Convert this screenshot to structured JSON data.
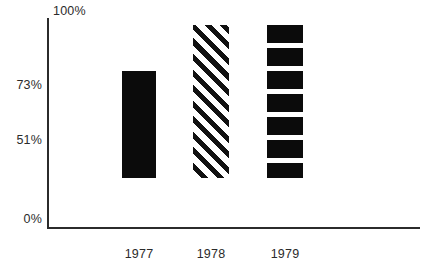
{
  "chart_data": {
    "type": "bar",
    "title": "",
    "subtitle": "",
    "xlabel": "",
    "ylabel": "",
    "categories": [
      "1977",
      "1978",
      "1979"
    ],
    "values": [
      51,
      73,
      73
    ],
    "ylim": [
      0,
      100
    ],
    "ytick_labels": [
      "0%",
      "51%",
      "73%",
      "100%"
    ],
    "ytick_values": [
      0,
      51,
      73,
      100
    ],
    "xtick_labels": [
      "1977",
      "1978",
      "1979"
    ],
    "grid": false,
    "legend": null,
    "series": [
      {
        "name": "",
        "values": [
          51,
          73,
          73
        ],
        "fills": [
          "solid-black",
          "diagonal-hatch",
          "horizontal-bands"
        ]
      }
    ],
    "annotations": [],
    "colors": {
      "bar": "#0b0b0b",
      "axis": "#2b2b2b",
      "background": "#ffffff",
      "text": "#2b2b2b"
    }
  },
  "axes": {
    "y_labels": {
      "top": "100%",
      "upper": "73%",
      "middle": "51%",
      "zero": "0%"
    },
    "x_labels": {
      "first": "1977",
      "second": "1978",
      "third": "1979"
    }
  }
}
